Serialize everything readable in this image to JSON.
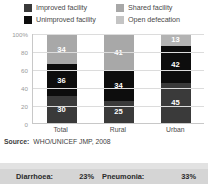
{
  "legend": {
    "items": [
      {
        "label": "Improved facility",
        "color": "#3a3a3a",
        "key": "improved"
      },
      {
        "label": "Shared facility",
        "color": "#a8a8a8",
        "key": "shared"
      },
      {
        "label": "Unimproved facility",
        "color": "#0d0d0d",
        "key": "unimproved"
      },
      {
        "label": "Open defecation",
        "color": "#c4c4c4",
        "key": "open_defecation"
      }
    ]
  },
  "source": {
    "label": "Source:",
    "text": "WHO/UNICEF JMP, 2008"
  },
  "strip": {
    "items": [
      {
        "name": "Diarrhoea:",
        "value": "23%"
      },
      {
        "name": "Pneumonia:",
        "value": "33%"
      }
    ]
  },
  "chart_data": {
    "type": "bar",
    "stacked": true,
    "title": "",
    "xlabel": "",
    "ylabel": "",
    "ylim": [
      0,
      100
    ],
    "grid": true,
    "legend_position": "top",
    "categories": [
      "Total",
      "Rural",
      "Urban"
    ],
    "ytick_labels": [
      "100%",
      "80",
      "60",
      "40",
      "20",
      "0"
    ],
    "ytick_values": [
      100,
      80,
      60,
      40,
      20,
      0
    ],
    "series": [
      {
        "name": "Improved facility",
        "color": "#3a3a3a",
        "values": [
          30,
          25,
          45
        ]
      },
      {
        "name": "Unimproved facility",
        "color": "#0d0d0d",
        "values": [
          36,
          34,
          42
        ]
      },
      {
        "name": "Shared facility",
        "color": "#a8a8a8",
        "values": [
          34,
          41,
          13
        ]
      }
    ],
    "bars": [
      {
        "category": "Total",
        "segments": [
          {
            "label": "30",
            "value": 30,
            "color": "#3a3a3a",
            "series": "Improved facility"
          },
          {
            "label": "36",
            "value": 36,
            "color": "#0d0d0d",
            "series": "Unimproved facility"
          },
          {
            "label": "34",
            "value": 34,
            "color": "#a8a8a8",
            "series": "Shared facility"
          }
        ]
      },
      {
        "category": "Rural",
        "segments": [
          {
            "label": "25",
            "value": 25,
            "color": "#3a3a3a",
            "series": "Improved facility"
          },
          {
            "label": "34",
            "value": 34,
            "color": "#0d0d0d",
            "series": "Unimproved facility"
          },
          {
            "label": "41",
            "value": 41,
            "color": "#a8a8a8",
            "series": "Shared facility"
          }
        ]
      },
      {
        "category": "Urban",
        "segments": [
          {
            "label": "45",
            "value": 45,
            "color": "#3a3a3a",
            "series": "Improved facility"
          },
          {
            "label": "42",
            "value": 42,
            "color": "#0d0d0d",
            "series": "Unimproved facility"
          },
          {
            "label": "13",
            "value": 13,
            "color": "#b3b3b3",
            "series": "Shared facility"
          }
        ]
      }
    ]
  }
}
